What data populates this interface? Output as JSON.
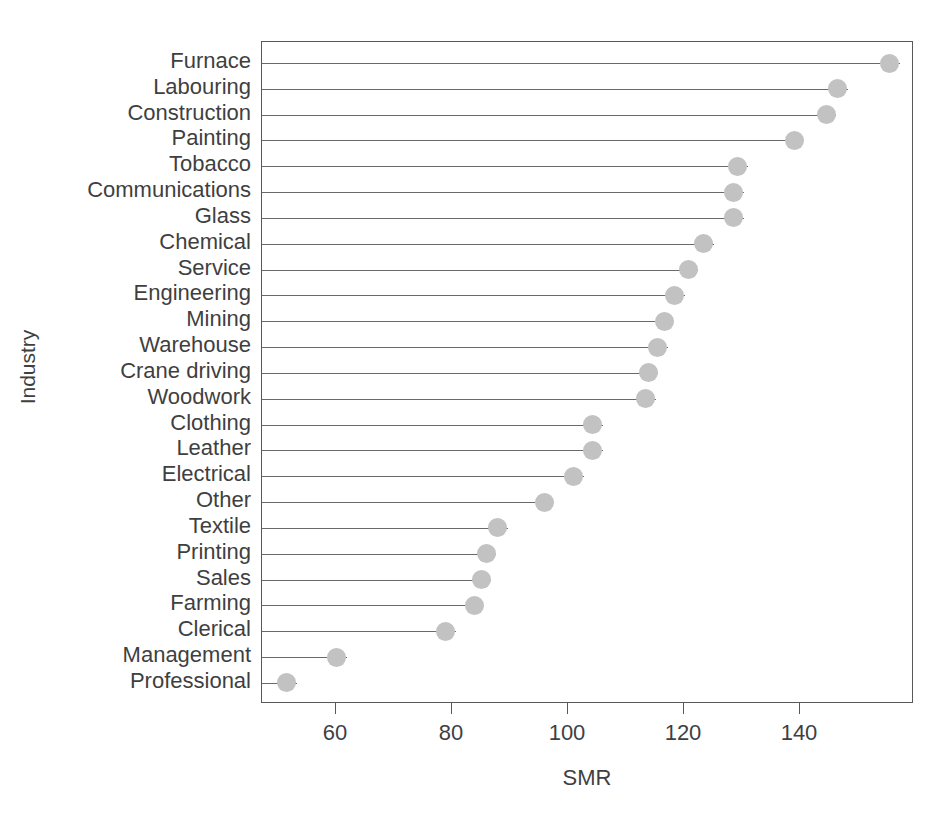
{
  "chart_data": {
    "type": "scatter",
    "subtype": "cleveland-dot-plot",
    "title": "",
    "xlabel": "SMR",
    "ylabel": "Industry",
    "xlim": [
      45,
      160
    ],
    "ylim": [
      0,
      26
    ],
    "grid": false,
    "legend": null,
    "x_ticks": [
      60,
      80,
      100,
      120,
      140
    ],
    "x_tick_labels": [
      "60",
      "80",
      "100",
      "120",
      "140"
    ],
    "orientation": "horizontal",
    "sorted": "descending",
    "marker": {
      "shape": "circle",
      "color": "#c2c2c2",
      "size": 19
    },
    "line": {
      "color": "#6a6a6a",
      "width": 1.4,
      "style": "solid"
    },
    "categories": [
      "Furnace",
      "Labouring",
      "Construction",
      "Painting",
      "Tobacco",
      "Communications",
      "Glass",
      "Chemical",
      "Service",
      "Engineering",
      "Mining",
      "Warehouse",
      "Crane driving",
      "Woodwork",
      "Clothing",
      "Leather",
      "Electrical",
      "Other",
      "Textile",
      "Printing",
      "Sales",
      "Farming",
      "Clerical",
      "Management",
      "Professional"
    ],
    "values": [
      155.5,
      146.5,
      144.5,
      139.0,
      129.3,
      128.6,
      128.6,
      123.4,
      120.7,
      118.4,
      116.6,
      115.5,
      113.8,
      113.4,
      104.3,
      104.3,
      101.0,
      95.9,
      87.9,
      85.9,
      85.0,
      83.8,
      78.9,
      60.1,
      51.5
    ]
  },
  "axes": {
    "x_title": "SMR",
    "y_title": "Industry"
  }
}
